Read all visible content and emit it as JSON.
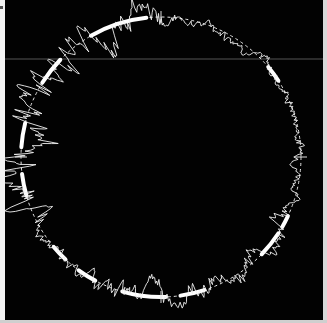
{
  "image": {
    "description": "Photograph of a circular polar trace (roundness-style plot): dashed reference circle with a jagged white trace and thick white arc segments on black background",
    "background_color": "#020202",
    "trace_color": "#f2f2f2",
    "scan_line_color": "#6a6a6a",
    "scan_line_y": 59
  },
  "plot": {
    "center": [
      161,
      157
    ],
    "reference_radius": 140,
    "thick_segments_deg": [
      [
        -120,
        -96
      ],
      [
        -148,
        -136
      ],
      [
        -176,
        -166
      ],
      [
        -196,
        -187
      ],
      [
        -40,
        -33
      ],
      [
        25,
        30
      ],
      [
        33,
        44
      ],
      [
        72,
        82
      ],
      [
        88,
        106
      ],
      [
        118,
        126
      ],
      [
        133,
        140
      ]
    ],
    "ticks_deg": [
      -90,
      0,
      90,
      180
    ],
    "seed": 7
  }
}
